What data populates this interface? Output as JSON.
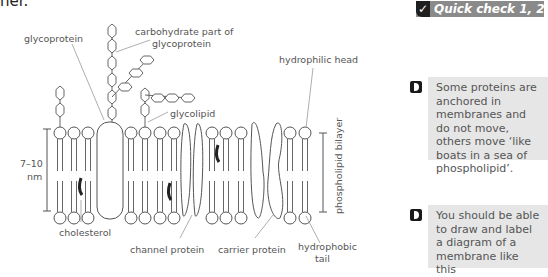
{
  "page": {
    "top_text_fragment": "her."
  },
  "diagram": {
    "labels": {
      "glycoprotein": "glycoprotein",
      "carbohydrate_line1": "carbohydrate part of",
      "carbohydrate_line2": "glycoprotein",
      "glycolipid": "glycolipid",
      "hydrophilic_head": "hydrophilic head",
      "thickness_line1": "7–10",
      "thickness_line2": "nm",
      "cholesterol": "cholesterol",
      "channel_protein": "channel protein",
      "carrier_protein": "carrier protein",
      "hydrophobic_line1": "hydrophobic",
      "hydrophobic_line2": "tail",
      "bilayer": "phospholipid bilayer"
    }
  },
  "sidebar": {
    "quick_check": {
      "icon": "check-icon",
      "label": "Quick check 1, 2"
    },
    "notes": [
      {
        "icon": "bullet-arrow-icon",
        "text": "Some proteins are anchored in membranes and do not move, others move ‘like boats in a sea of phospholipid’."
      },
      {
        "icon": "bullet-arrow-icon",
        "text": "You should be able to draw and label a diagram of a membrane like this"
      }
    ]
  },
  "colors": {
    "badge": "#8a8a8a",
    "note_bg": "#e6e6e6",
    "line": "#555555",
    "cholesterol": "#222222"
  }
}
